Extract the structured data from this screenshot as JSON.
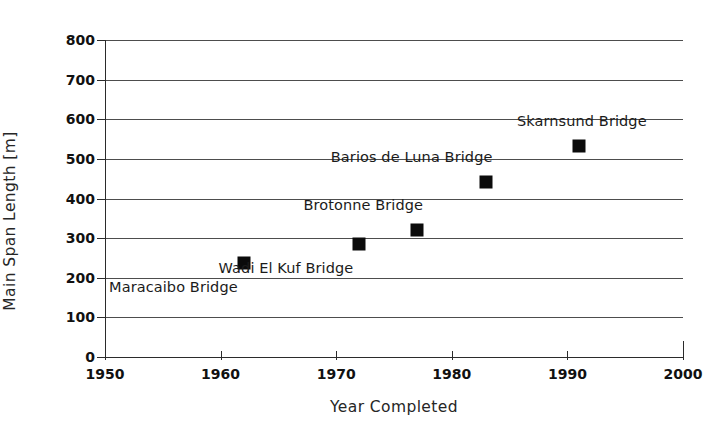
{
  "chart_data": {
    "type": "scatter",
    "title": "",
    "xlabel": "Year Completed",
    "ylabel": "Main Span Length [m]",
    "xlim": [
      1950,
      2000
    ],
    "ylim": [
      0,
      800
    ],
    "xticks": [
      1950,
      1960,
      1970,
      1980,
      1990,
      2000
    ],
    "xtick_labels": [
      "1950",
      "1960",
      "1970",
      "1980",
      "1990",
      "2000"
    ],
    "yticks": [
      0,
      100,
      200,
      300,
      400,
      500,
      600,
      700,
      800
    ],
    "ytick_labels": [
      "0",
      "100",
      "200",
      "300",
      "400",
      "500",
      "600",
      "700",
      "800"
    ],
    "grid": "horizontal",
    "legend": "none",
    "marker_style": "filled-square",
    "marker_color": "#0b0b0b",
    "gridline_color": "#4d4d4d",
    "axis_color": "#2b2b2b",
    "points": [
      {
        "name": "Maracaibo Bridge",
        "x": 1962,
        "y": 237,
        "label": "Maracaibo Bridge",
        "label_position": "below-left"
      },
      {
        "name": "Wadi El Kuf Bridge",
        "x": 1972,
        "y": 285,
        "label": "Wadi El Kuf Bridge",
        "label_position": "below-left"
      },
      {
        "name": "Brotonne Bridge",
        "x": 1977,
        "y": 320,
        "label": "Brotonne Bridge",
        "label_position": "above-left"
      },
      {
        "name": "Barios de Luna Bridge",
        "x": 1983,
        "y": 442,
        "label": "Barios de Luna Bridge",
        "label_position": "above-left"
      },
      {
        "name": "Skarnsund Bridge",
        "x": 1991,
        "y": 532,
        "label": "Skarnsund Bridge",
        "label_position": "above-right"
      }
    ]
  }
}
